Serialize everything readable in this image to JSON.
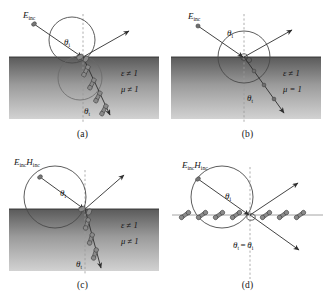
{
  "figure": {
    "top_bleed_text": "               ",
    "captions": {
      "a": "(a)",
      "b": "(b)",
      "c": "(c)",
      "d": "(d)"
    },
    "colors": {
      "ink": "#141414",
      "line": "#3a3a3a",
      "medium_top": "#5d5d5d",
      "medium_bottom": "#c9c9c9",
      "dipole_fill": "#8a8a8a",
      "dashed_axis": "#9a9a9a"
    },
    "panels": [
      {
        "id": "a",
        "name": "oblique-incidence-lossy-dielectric-magnetic",
        "incident_label": "E",
        "incident_sub": "inc",
        "angle_incidence_label": "θ",
        "angle_incidence_sub": "i",
        "angle_transmission_label": "θ",
        "angle_transmission_sub": "t",
        "medium_permittivity": "ε ≠ 1",
        "medium_permeability": "μ ≠ 1",
        "transmitted_marker": "dipole",
        "has_shaded_medium": true,
        "circle_style": "small-above-interface"
      },
      {
        "id": "b",
        "name": "oblique-incidence-dielectric-nonmagnetic",
        "incident_label": "E",
        "incident_sub": "inc",
        "angle_incidence_label": "θ",
        "angle_incidence_sub": "i",
        "angle_transmission_label": "θ",
        "angle_transmission_sub": "t",
        "medium_permittivity": "ε ≠ 1",
        "medium_permeability": "μ = 1",
        "transmitted_marker": "dot",
        "has_shaded_medium": true,
        "circle_style": "centered-on-interface"
      },
      {
        "id": "c",
        "name": "oblique-incidence-both-fields-lossy",
        "incident_label_e": "E",
        "incident_sub_e": "inc",
        "incident_label_h": "H",
        "incident_sub_h": "inc",
        "angle_incidence_label": "θ",
        "angle_incidence_sub": "i",
        "angle_transmission_label": "θ",
        "angle_transmission_sub": "t",
        "medium_permittivity": "ε ≠ 1",
        "medium_permeability": "μ ≠ 1",
        "transmitted_marker": "dipole",
        "has_shaded_medium": true,
        "circle_style": "large-left-tangent"
      },
      {
        "id": "d",
        "name": "oblique-incidence-free-space-equal-angles",
        "incident_label_e": "E",
        "incident_sub_e": "inc",
        "incident_label_h": "H",
        "incident_sub_h": "inc",
        "angle_incidence_label": "θ",
        "angle_incidence_sub": "i",
        "angle_relation_left": "θ",
        "angle_relation_left_sub": "t",
        "angle_relation_eq": "=",
        "angle_relation_right": "θ",
        "angle_relation_right_sub": "i",
        "transmitted_marker": "dipole-horizontal-row",
        "has_shaded_medium": false,
        "circle_style": "large-left-tangent"
      }
    ]
  }
}
